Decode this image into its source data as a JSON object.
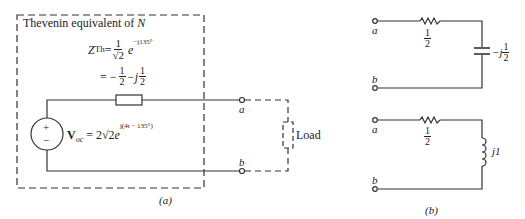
{
  "figure_a": {
    "box_title_prefix": "Thevenin equivalent of ",
    "box_title_network": "N",
    "zth": {
      "symbol": "Z",
      "subscript": "Th",
      "eq": "=",
      "coef_num": "1",
      "coef_den": "√2",
      "exp_base": "e",
      "exponent": "−j135°",
      "line2_eq": "= −",
      "line2_num1": "1",
      "line2_den1": "2",
      "line2_mid": " −j",
      "line2_num2": "1",
      "line2_den2": "2"
    },
    "source": {
      "plus": "+",
      "minus": "−",
      "symbol": "V",
      "subscript": "oc",
      "eq": " = 2√2",
      "exp_base": "e",
      "exponent": "j(4t − 135°)"
    },
    "terminal_a": "a",
    "terminal_b": "b",
    "load_label": "Load",
    "caption": "(a)"
  },
  "figure_b": {
    "top_circuit": {
      "terminal_a": "a",
      "terminal_b": "b",
      "resistor_num": "1",
      "resistor_den": "2",
      "capacitor_prefix": "−j",
      "capacitor_num": "1",
      "capacitor_den": "2"
    },
    "bottom_circuit": {
      "terminal_a": "a",
      "terminal_b": "b",
      "resistor_num": "1",
      "resistor_den": "2",
      "inductor_label": "j1"
    },
    "caption": "(b)"
  },
  "colors": {
    "line": "#333333",
    "background": "#ffffff"
  }
}
